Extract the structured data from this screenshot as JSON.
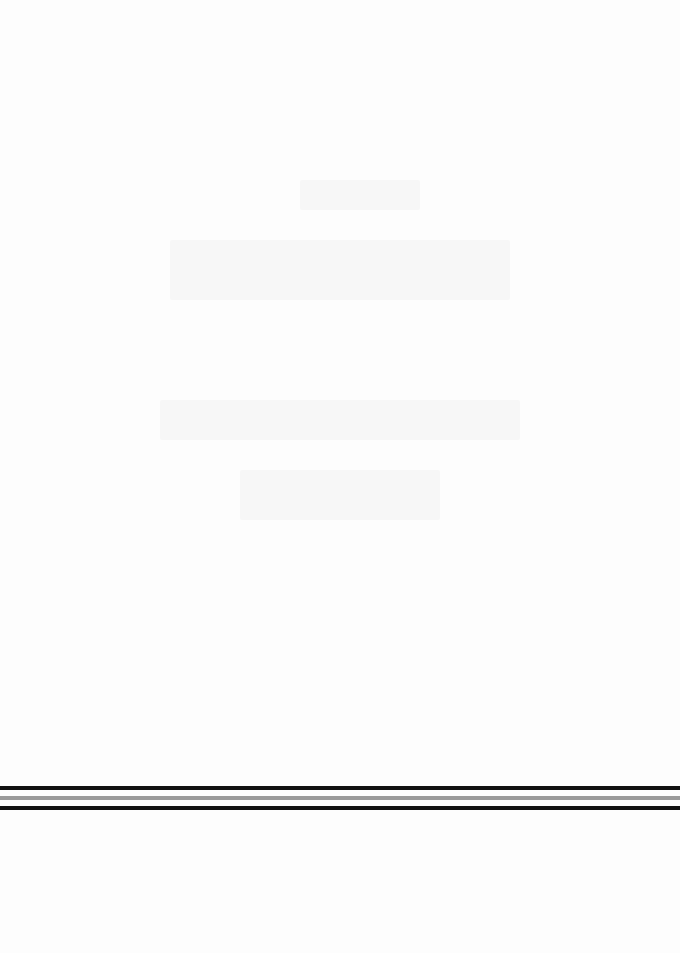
{
  "page": {
    "background": "#fdfdfd",
    "content": "blank scanned page (only faint show-through, no legible text)"
  },
  "rules": [
    {
      "name": "top-black-rule",
      "color": "#111111",
      "y": 786,
      "thickness": 4
    },
    {
      "name": "middle-gray-rule",
      "color": "#9a9a9a",
      "y": 796,
      "thickness": 4
    },
    {
      "name": "bottom-black-rule",
      "color": "#111111",
      "y": 806,
      "thickness": 4
    }
  ]
}
